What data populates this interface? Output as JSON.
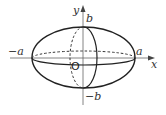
{
  "diagram": {
    "type": "ellipsoid",
    "axes": {
      "x_label": "x",
      "y_label": "y",
      "origin_label": "O"
    },
    "labels": {
      "neg_a": "−a",
      "pos_a": "a",
      "pos_b": "b",
      "neg_b": "−b"
    },
    "colors": {
      "stroke": "#222222",
      "axis": "#555555",
      "background": "#ffffff"
    }
  }
}
